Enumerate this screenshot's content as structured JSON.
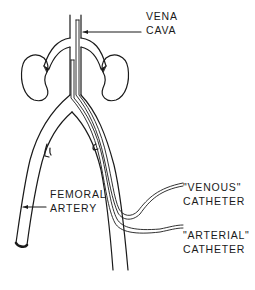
{
  "diagram": {
    "colors": {
      "ink": "#1a1a1a",
      "background": "#ffffff"
    },
    "labels": {
      "vena_cava": {
        "line1": "VENA",
        "line2": "CAVA"
      },
      "femoral_artery": {
        "line1": "FEMORAL",
        "line2": "ARTERY"
      },
      "venous_catheter": {
        "line1": "\"VENOUS\"",
        "line2": "CATHETER"
      },
      "arterial_catheter": {
        "line1": "\"ARTERIAL\"",
        "line2": "CATHETER"
      }
    },
    "structures": [
      "vena-cava",
      "left-kidney",
      "right-kidney",
      "left-renal-vessel",
      "right-renal-vessel",
      "left-femoral-branch",
      "right-femoral-branch",
      "venous-catheter",
      "arterial-catheter"
    ]
  }
}
